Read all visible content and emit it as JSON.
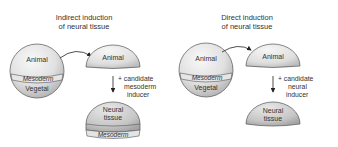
{
  "panels": [
    {
      "title_line1": "Indirect induction",
      "title_line2": "of neural tissue",
      "embryo": {
        "top": "Animal",
        "middle": "Mesoderm",
        "bottom": "Vegetal"
      },
      "explant": "Animal",
      "treatment_line1": "+ candidate",
      "treatment_line2": "mesoderm",
      "treatment_line3": "inducer",
      "result_line1": "Neural",
      "result_line2": "tissue",
      "result_band": "Mesoderm"
    },
    {
      "title_line1": "Direct induction",
      "title_line2": "of neural tissue",
      "embryo": {
        "top": "Animal",
        "middle": "Mesoderm",
        "bottom": "Vegetal"
      },
      "explant": "Animal",
      "treatment_line1": "+ candidate",
      "treatment_line2": "neural",
      "treatment_line3": "inducer",
      "result_line1": "Neural",
      "result_line2": "tissue"
    }
  ],
  "colors": {
    "light_fill": "#eeeeee",
    "mid_fill": "#d4d4d4",
    "dark_fill": "#b8b8b8",
    "stroke": "#555555",
    "text": "#333333"
  }
}
